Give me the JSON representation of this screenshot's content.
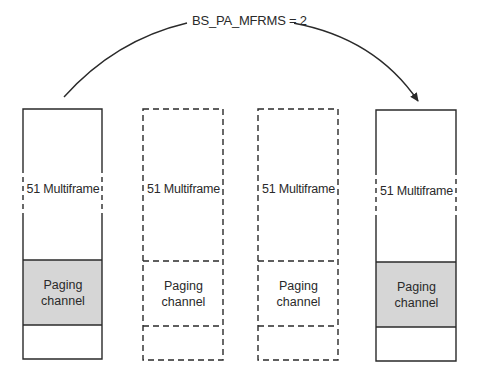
{
  "diagram": {
    "arrow_label": "BS_PA_MFRMS = 2",
    "colors": {
      "line": "#2a2a2a",
      "paging_fill": "#d6d6d6",
      "background": "#ffffff"
    },
    "boxes": [
      {
        "id": "multiframe-1",
        "style": "solid",
        "label": "51 Multiframe",
        "paging_label_line1": "Paging",
        "paging_label_line2": "channel",
        "paging_highlighted": true
      },
      {
        "id": "multiframe-2",
        "style": "dashed",
        "label": "51 Multiframe",
        "paging_label_line1": "Paging",
        "paging_label_line2": "channel",
        "paging_highlighted": false
      },
      {
        "id": "multiframe-3",
        "style": "dashed",
        "label": "51 Multiframe",
        "paging_label_line1": "Paging",
        "paging_label_line2": "channel",
        "paging_highlighted": false
      },
      {
        "id": "multiframe-4",
        "style": "solid",
        "label": "51 Multiframe",
        "paging_label_line1": "Paging",
        "paging_label_line2": "channel",
        "paging_highlighted": true
      }
    ]
  }
}
